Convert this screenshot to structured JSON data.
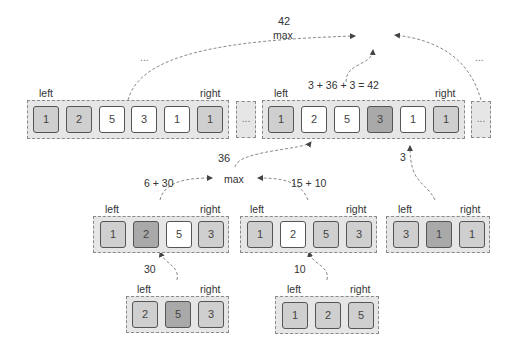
{
  "diagram": {
    "top": {
      "max_label": "max",
      "max_value": "42",
      "sum_label": "3 + 36 + 3 = 42",
      "left_ellipsis": "...",
      "right_ellipsis": "...",
      "left_group": {
        "left_label": "left",
        "right_label": "right",
        "cells": [
          {
            "value": "1",
            "shade": "light"
          },
          {
            "value": "2",
            "shade": "light"
          },
          {
            "value": "5",
            "shade": "white"
          },
          {
            "value": "3",
            "shade": "white"
          },
          {
            "value": "1",
            "shade": "white"
          },
          {
            "value": "1",
            "shade": "light"
          }
        ]
      },
      "middle_ellipsis_box": "...",
      "right_group": {
        "left_label": "left",
        "right_label": "right",
        "cells": [
          {
            "value": "1",
            "shade": "light"
          },
          {
            "value": "2",
            "shade": "white"
          },
          {
            "value": "5",
            "shade": "white"
          },
          {
            "value": "3",
            "shade": "dark"
          },
          {
            "value": "1",
            "shade": "white"
          },
          {
            "value": "1",
            "shade": "light"
          }
        ]
      },
      "right_ellipsis_box": "...",
      "edge_label_3": "3"
    },
    "middle": {
      "max_label": "max",
      "max_value": "36",
      "left_sum": "6 + 30",
      "right_sum": "15 + 10",
      "left_group": {
        "left_label": "left",
        "right_label": "right",
        "cells": [
          {
            "value": "1",
            "shade": "light"
          },
          {
            "value": "2",
            "shade": "dark"
          },
          {
            "value": "5",
            "shade": "white"
          },
          {
            "value": "3",
            "shade": "light"
          }
        ]
      },
      "right_group": {
        "left_label": "left",
        "right_label": "right",
        "cells": [
          {
            "value": "1",
            "shade": "light"
          },
          {
            "value": "2",
            "shade": "white"
          },
          {
            "value": "5",
            "shade": "light"
          },
          {
            "value": "3",
            "shade": "light"
          }
        ]
      },
      "far_group": {
        "left_label": "left",
        "right_label": "right",
        "cells": [
          {
            "value": "3",
            "shade": "light"
          },
          {
            "value": "1",
            "shade": "dark"
          },
          {
            "value": "1",
            "shade": "light"
          }
        ]
      }
    },
    "bottom": {
      "left_edge_label": "30",
      "right_edge_label": "10",
      "left_group": {
        "left_label": "left",
        "right_label": "right",
        "cells": [
          {
            "value": "2",
            "shade": "light"
          },
          {
            "value": "5",
            "shade": "dark"
          },
          {
            "value": "3",
            "shade": "light"
          }
        ]
      },
      "right_group": {
        "left_label": "left",
        "right_label": "right",
        "cells": [
          {
            "value": "1",
            "shade": "light"
          },
          {
            "value": "2",
            "shade": "light"
          },
          {
            "value": "5",
            "shade": "light"
          }
        ]
      }
    },
    "colors": {
      "light": "#cfcfcf",
      "dark": "#a9a9a9",
      "white": "#ffffff",
      "group_bg": "#e6e6e6",
      "edge": "#888888"
    }
  }
}
